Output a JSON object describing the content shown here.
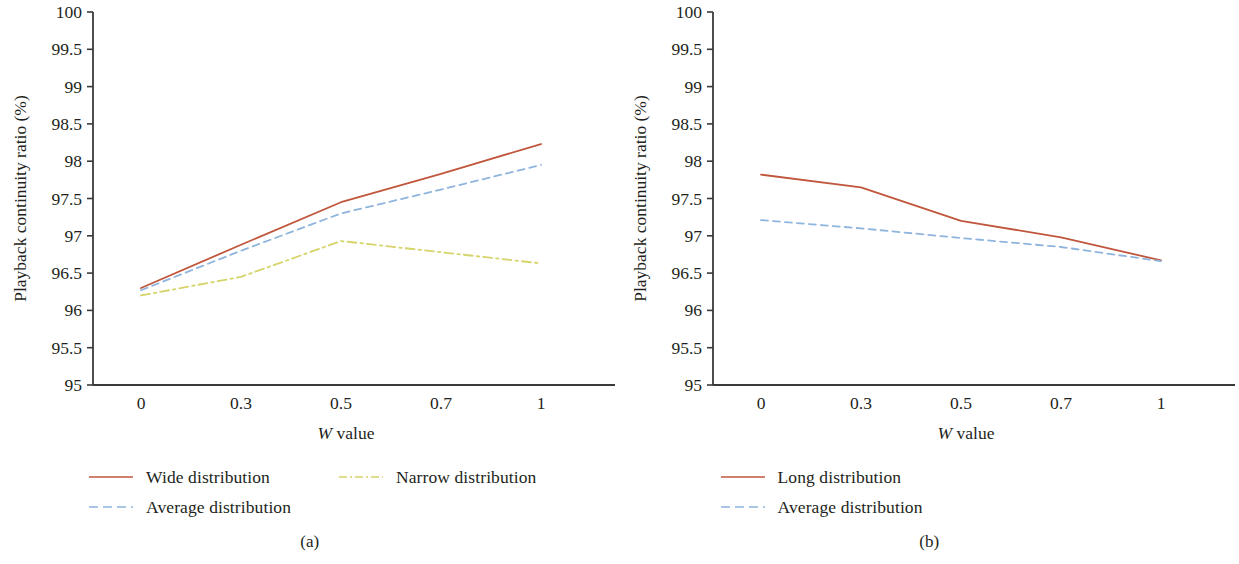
{
  "figure": {
    "panels": [
      {
        "id": "a",
        "subcaption": "(a)",
        "ylabel": "Playback continuity ratio (%)",
        "xlabel_italic": "W",
        "xlabel_rest": " value",
        "legend": [
          {
            "label": "Wide distribution",
            "color": "#c0563c",
            "style": "solid"
          },
          {
            "label": "Narrow distribution",
            "color": "#d6d46a",
            "style": "dashdot"
          },
          {
            "label": "Average distribution",
            "color": "#8fb4dd",
            "style": "dashed"
          }
        ]
      },
      {
        "id": "b",
        "subcaption": "(b)",
        "ylabel": "Playback continuity ratio (%)",
        "xlabel_italic": "W",
        "xlabel_rest": " value",
        "legend": [
          {
            "label": "Long distribution",
            "color": "#c0563c",
            "style": "solid"
          },
          {
            "label": "Average distribution",
            "color": "#8fb4dd",
            "style": "dashed"
          }
        ]
      }
    ]
  },
  "chart_data": [
    {
      "type": "line",
      "title": "(a)",
      "xlabel": "W value",
      "ylabel": "Playback continuity ratio (%)",
      "categories": [
        "0",
        "0.3",
        "0.5",
        "0.7",
        "1"
      ],
      "ylim": [
        95,
        100
      ],
      "yticks": [
        "95",
        "95.5",
        "96",
        "96.5",
        "97",
        "97.5",
        "98",
        "98.5",
        "99",
        "99.5",
        "100"
      ],
      "grid": false,
      "legend_position": "below",
      "series": [
        {
          "name": "Wide distribution",
          "values": [
            96.3,
            96.88,
            97.45,
            97.83,
            98.23
          ],
          "color": "#c0563c",
          "style": "solid"
        },
        {
          "name": "Narrow distribution",
          "values": [
            96.2,
            96.45,
            96.93,
            96.78,
            96.63
          ],
          "color": "#d6d46a",
          "style": "dashdot"
        },
        {
          "name": "Average distribution",
          "values": [
            96.27,
            96.8,
            97.3,
            97.62,
            97.95
          ],
          "color": "#8fb4dd",
          "style": "dashed"
        }
      ]
    },
    {
      "type": "line",
      "title": "(b)",
      "xlabel": "W value",
      "ylabel": "Playback continuity ratio (%)",
      "categories": [
        "0",
        "0.3",
        "0.5",
        "0.7",
        "1"
      ],
      "ylim": [
        95,
        100
      ],
      "yticks": [
        "95",
        "95.5",
        "96",
        "96.5",
        "97",
        "97.5",
        "98",
        "98.5",
        "99",
        "99.5",
        "100"
      ],
      "grid": false,
      "legend_position": "below",
      "series": [
        {
          "name": "Long distribution",
          "values": [
            97.82,
            97.65,
            97.2,
            96.98,
            96.67
          ],
          "color": "#c0563c",
          "style": "solid"
        },
        {
          "name": "Average distribution",
          "values": [
            97.21,
            97.1,
            96.97,
            96.85,
            96.66
          ],
          "color": "#8fb4dd",
          "style": "dashed"
        }
      ]
    }
  ]
}
